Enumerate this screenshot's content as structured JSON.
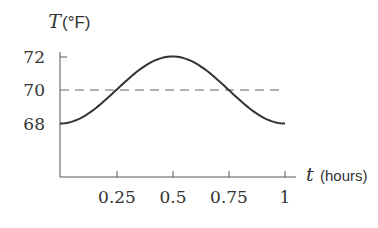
{
  "chart_data": {
    "type": "line",
    "title": "",
    "xlabel": "t (hours)",
    "ylabel": "T(°F)",
    "x_ticks": [
      "0.25",
      "0.5",
      "0.75",
      "1"
    ],
    "y_ticks": [
      "72",
      "70",
      "68"
    ],
    "xlim": [
      0,
      1
    ],
    "ylim": [
      66,
      72.5
    ],
    "grid": false,
    "series": [
      {
        "name": "T(t)",
        "style": "solid",
        "x": [
          0,
          0.125,
          0.25,
          0.375,
          0.5,
          0.625,
          0.75,
          0.875,
          1
        ],
        "values": [
          68,
          68.59,
          70,
          71.41,
          72,
          71.41,
          70,
          68.59,
          68
        ]
      },
      {
        "name": "average",
        "style": "dashed",
        "x": [
          0,
          1
        ],
        "values": [
          70,
          70
        ]
      }
    ]
  },
  "labels": {
    "y_var": "T",
    "y_unit": "(°F)",
    "x_var": "t",
    "x_unit": "(hours)",
    "y72": "72",
    "y70": "70",
    "y68": "68",
    "x025": "0.25",
    "x05": "0.5",
    "x075": "0.75",
    "x1": "1"
  }
}
